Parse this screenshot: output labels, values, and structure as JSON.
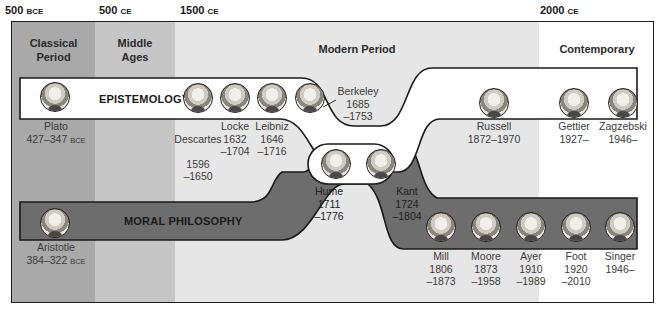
{
  "timeline": {
    "ticks": [
      {
        "label": "500",
        "suffix": "BCE"
      },
      {
        "label": "500",
        "suffix": "CE"
      },
      {
        "label": "1500",
        "suffix": "CE"
      },
      {
        "label": "2000",
        "suffix": "CE"
      }
    ],
    "periods": [
      {
        "label": "Classical\nPeriod",
        "color": "#a9a9a9"
      },
      {
        "label": "Middle\nAges",
        "color": "#c6c6c6"
      },
      {
        "label": "Modern Period",
        "color": "#e6e6e6"
      },
      {
        "label": "Contemporary",
        "color": "#ffffff"
      }
    ]
  },
  "lanes": {
    "epistemology": {
      "title": "EPISTEMOLOGY",
      "color": "#ffffff"
    },
    "moral": {
      "title": "MORAL PHILOSOPHY",
      "color": "#6d6d6d"
    }
  },
  "philosophers": [
    {
      "name": "Plato",
      "years": "427–347",
      "suffix": "BCE",
      "lane": "epistemology"
    },
    {
      "name": "Descartes",
      "years": "1596\n–1650",
      "lane": "epistemology"
    },
    {
      "name": "Locke",
      "years": "1632\n–1704",
      "lane": "epistemology"
    },
    {
      "name": "Leibniz",
      "years": "1646\n–1716",
      "lane": "epistemology"
    },
    {
      "name": "Berkeley",
      "years": "1685\n–1753",
      "lane": "epistemology"
    },
    {
      "name": "Hume",
      "years": "1711\n–1776",
      "lane": "both"
    },
    {
      "name": "Kant",
      "years": "1724\n–1804",
      "lane": "both"
    },
    {
      "name": "Russell",
      "years": "1872–1970",
      "lane": "epistemology"
    },
    {
      "name": "Gettier",
      "years": "1927–",
      "lane": "epistemology"
    },
    {
      "name": "Zagzebski",
      "years": "1946–",
      "lane": "epistemology"
    },
    {
      "name": "Aristotle",
      "years": "384–322",
      "suffix": "BCE",
      "lane": "moral"
    },
    {
      "name": "Mill",
      "years": "1806\n–1873",
      "lane": "moral"
    },
    {
      "name": "Moore",
      "years": "1873\n–1958",
      "lane": "moral"
    },
    {
      "name": "Ayer",
      "years": "1910\n–1989",
      "lane": "moral"
    },
    {
      "name": "Foot",
      "years": "1920\n–2010",
      "lane": "moral"
    },
    {
      "name": "Singer",
      "years": "1946–",
      "lane": "moral"
    }
  ]
}
